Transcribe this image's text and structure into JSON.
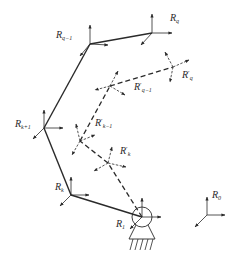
{
  "diagram": {
    "colors": {
      "line": "#2a2a2a",
      "background": "#ffffff"
    },
    "frames": [
      {
        "id": "R_q",
        "base": "R",
        "sub": "q",
        "prime": "",
        "style": "solid"
      },
      {
        "id": "R_q-1",
        "base": "R",
        "sub": "q−1",
        "prime": "",
        "style": "solid"
      },
      {
        "id": "R_k+1",
        "base": "R",
        "sub": "k+1",
        "prime": "",
        "style": "solid"
      },
      {
        "id": "R_k",
        "base": "R",
        "sub": "k",
        "prime": "",
        "style": "solid"
      },
      {
        "id": "R_1",
        "base": "R",
        "sub": "1",
        "prime": "",
        "style": "solid"
      },
      {
        "id": "R_0",
        "base": "R",
        "sub": "0",
        "prime": "",
        "style": "solid"
      },
      {
        "id": "R'_q",
        "base": "R",
        "sub": "q",
        "prime": "′",
        "style": "dashed"
      },
      {
        "id": "R'_q-1",
        "base": "R",
        "sub": "q−1",
        "prime": "′",
        "style": "dashed"
      },
      {
        "id": "R'_k-1",
        "base": "R",
        "sub": "k−1",
        "prime": "′",
        "style": "dashed"
      },
      {
        "id": "R'_k",
        "base": "R",
        "sub": "k",
        "prime": "′",
        "style": "dashed"
      }
    ],
    "labels": {
      "rq": {
        "base": "R",
        "sub": "q"
      },
      "rq1": {
        "base": "R",
        "sub": "q−1"
      },
      "rk1": {
        "base": "R",
        "sub": "k+1"
      },
      "rk": {
        "base": "R",
        "sub": "k"
      },
      "r1": {
        "base": "R",
        "sub": "1"
      },
      "r0": {
        "base": "R",
        "sub": "0"
      },
      "rqp": {
        "base": "R",
        "prime": "′",
        "sub": "q"
      },
      "rq1p": {
        "base": "R",
        "prime": "′",
        "sub": "q−1"
      },
      "rk1p": {
        "base": "R",
        "prime": "′",
        "sub": "k−1"
      },
      "rkp": {
        "base": "R",
        "prime": "′",
        "sub": "k"
      }
    }
  }
}
